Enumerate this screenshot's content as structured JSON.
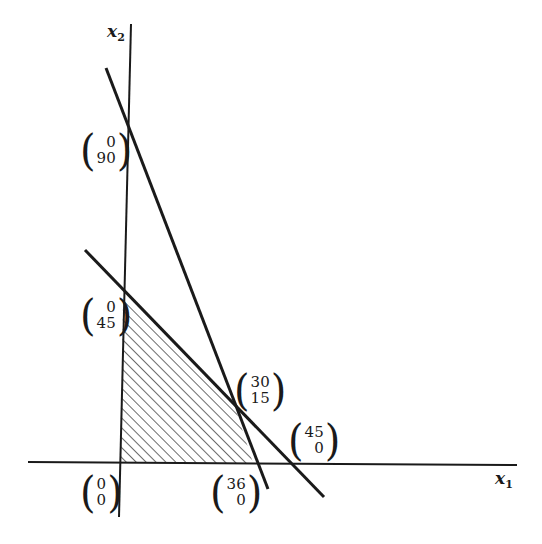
{
  "diagram": {
    "type": "linear-programming-feasible-region",
    "axes": {
      "x_label": "x",
      "x_sub": "1",
      "y_label": "x",
      "y_sub": "2"
    },
    "colors": {
      "ink": "#1a1a1a",
      "background": "#ffffff"
    },
    "points": [
      {
        "id": "origin",
        "top": "0",
        "bottom": "0"
      },
      {
        "id": "y-90",
        "top": "0",
        "bottom": "90"
      },
      {
        "id": "y-45",
        "top": "0",
        "bottom": "45"
      },
      {
        "id": "vertex-30-15",
        "top": "30",
        "bottom": "15"
      },
      {
        "id": "x-36",
        "top": "36",
        "bottom": "0"
      },
      {
        "id": "x-45",
        "top": "45",
        "bottom": "0"
      }
    ],
    "constraint_lines": [
      {
        "name": "steep-line",
        "through": [
          [
            0,
            90
          ],
          [
            36,
            0
          ]
        ]
      },
      {
        "name": "shallow-line",
        "through": [
          [
            0,
            45
          ],
          [
            45,
            0
          ]
        ]
      }
    ],
    "feasible_region": {
      "vertices": [
        [
          0,
          0
        ],
        [
          0,
          45
        ],
        [
          30,
          15
        ],
        [
          36,
          0
        ]
      ],
      "fill": "hatched"
    }
  }
}
